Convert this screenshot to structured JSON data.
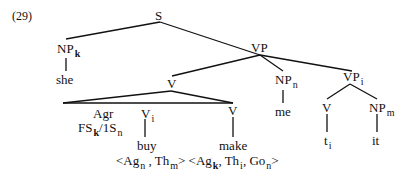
{
  "example_number": "(29)",
  "tree": {
    "S": {
      "label": "S"
    },
    "NP_k": {
      "label": "NP",
      "sub": "k",
      "leaf": "she"
    },
    "VP": {
      "label": "VP"
    },
    "V_top": {
      "label": "V"
    },
    "NP_n": {
      "label": "NP",
      "sub": "n",
      "leaf": "me"
    },
    "VP_i": {
      "label": "VP",
      "sub": "i"
    },
    "Agr": {
      "label": "Agr",
      "features": {
        "a": "FS",
        "a_sub": "k",
        "sep": "/1S",
        "b_sub": "n"
      }
    },
    "V_i": {
      "label": "V",
      "sub": "i",
      "leaf": "buy"
    },
    "V_make": {
      "label": "V",
      "leaf": "make"
    },
    "V_trace": {
      "label": "V",
      "leaf": "t",
      "leaf_sub": "i"
    },
    "NP_m": {
      "label": "NP",
      "sub": "m",
      "leaf": "it"
    }
  },
  "theta_grid": {
    "buy": {
      "open": "<Ag",
      "s1": "n",
      "mid": " , Th",
      "s2": "m",
      "close": ">"
    },
    "make": {
      "open": " <Ag",
      "s1": "k",
      "mid": ", Th",
      "s2": "i",
      "mid2": ", Go",
      "s3": "n",
      "close": ">"
    }
  }
}
